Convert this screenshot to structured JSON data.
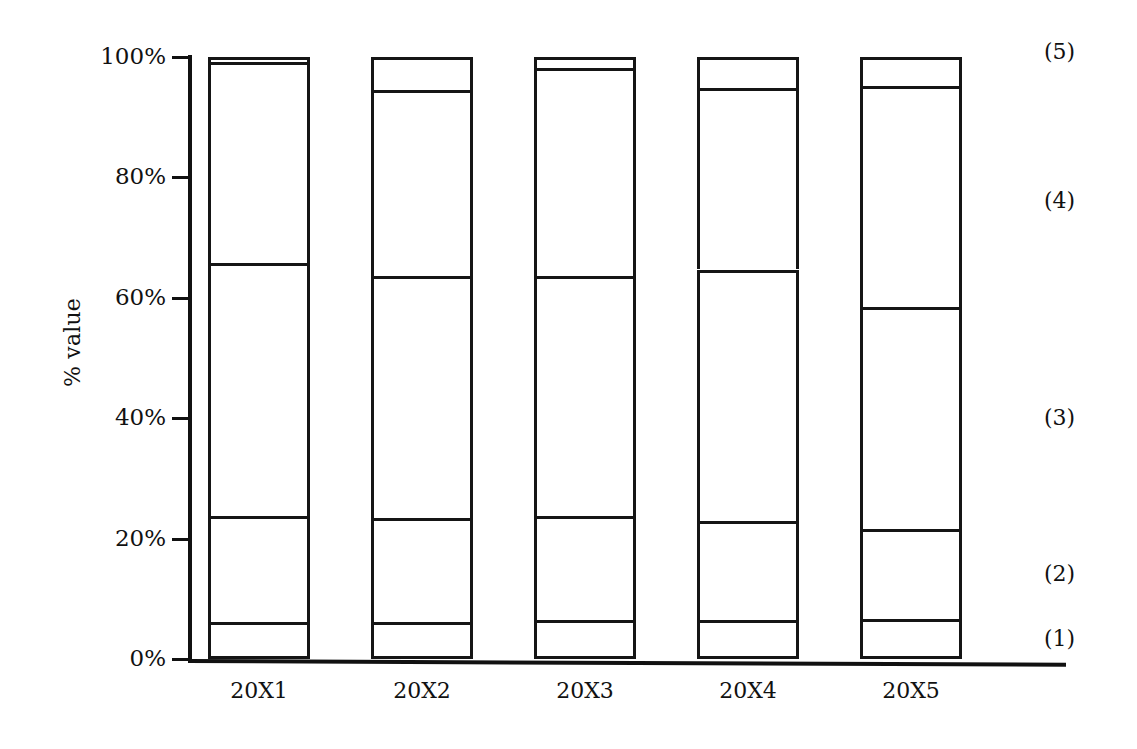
{
  "chart_data": {
    "type": "bar",
    "subtype": "stacked-100-percent",
    "title": "",
    "xlabel": "",
    "ylabel": "% value",
    "ylim": [
      0,
      100
    ],
    "y_ticks": [
      "0%",
      "20%",
      "40%",
      "60%",
      "80%",
      "100%"
    ],
    "y_tick_values": [
      0,
      20,
      40,
      60,
      80,
      100
    ],
    "grid": false,
    "legend_position": "right-outside",
    "categories": [
      "20X1",
      "20X2",
      "20X3",
      "20X4",
      "20X5"
    ],
    "series": [
      {
        "name": "(1)",
        "values": [
          6.2,
          6.2,
          6.4,
          6.4,
          6.6
        ]
      },
      {
        "name": "(2)",
        "values": [
          17.6,
          17.2,
          17.4,
          16.6,
          15.0
        ]
      },
      {
        "name": "(3)",
        "values": [
          41.9,
          40.2,
          39.9,
          41.7,
          36.9
        ]
      },
      {
        "name": "(4)",
        "values": [
          33.5,
          30.9,
          34.4,
          30.2,
          36.6
        ]
      },
      {
        "name": "(5)",
        "values": [
          0.8,
          5.5,
          1.9,
          5.1,
          4.9
        ]
      }
    ],
    "cumulative_tops": {
      "20X1": [
        6.2,
        23.8,
        65.7,
        99.2,
        100.0
      ],
      "20X2": [
        6.2,
        23.4,
        63.6,
        94.5,
        100.0
      ],
      "20X3": [
        6.4,
        23.8,
        63.7,
        98.1,
        100.0
      ],
      "20X4": [
        6.4,
        23.0,
        64.7,
        94.9,
        100.0
      ],
      "20X5": [
        6.6,
        21.6,
        58.5,
        95.1,
        100.0
      ]
    },
    "legend_entries": [
      "(5)",
      "(4)",
      "(3)",
      "(2)",
      "(1)"
    ],
    "colors": {
      "bar_fill": "#ffffff",
      "bar_stroke": "#151515",
      "axis": "#111111",
      "text": "#111111",
      "background": "#ffffff"
    }
  },
  "axes": {
    "y_title": "% value",
    "y_tick_labels": [
      "100%",
      "80%",
      "60%",
      "40%",
      "20%",
      "0%"
    ],
    "x_tick_labels": [
      "20X1",
      "20X2",
      "20X3",
      "20X4",
      "20X5"
    ]
  },
  "legend": {
    "items": [
      {
        "label": "(5)"
      },
      {
        "label": "(4)"
      },
      {
        "label": "(3)"
      },
      {
        "label": "(2)"
      },
      {
        "label": "(1)"
      }
    ]
  }
}
